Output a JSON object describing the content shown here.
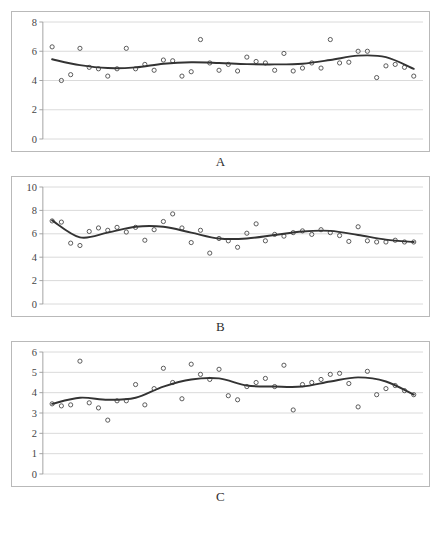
{
  "figure": {
    "title": "",
    "panel_count": 3
  },
  "chart_data": [
    {
      "id": "A",
      "type": "scatter",
      "title": "",
      "caption": "A",
      "xlabel": "",
      "ylabel": "",
      "ylim": [
        0,
        8
      ],
      "yticks": [
        0,
        2,
        4,
        6,
        8
      ],
      "yticklabels": [
        "0",
        "2",
        "4",
        "6",
        "8"
      ],
      "xlim": [
        0,
        41
      ],
      "xticks": [],
      "grid": true,
      "legend": "none",
      "series": [
        {
          "name": "observations",
          "marker": "open-circle",
          "x": [
            1,
            2,
            3,
            4,
            5,
            6,
            7,
            8,
            9,
            10,
            11,
            12,
            13,
            14,
            15,
            16,
            17,
            18,
            19,
            20,
            21,
            22,
            23,
            24,
            25,
            26,
            27,
            28,
            29,
            30,
            31,
            32,
            33,
            34,
            35,
            36,
            37,
            38,
            39,
            40
          ],
          "values": [
            6.3,
            4.0,
            4.4,
            6.2,
            4.9,
            4.8,
            4.3,
            4.8,
            6.2,
            4.8,
            5.1,
            4.7,
            5.4,
            5.35,
            4.3,
            4.6,
            6.8,
            5.2,
            4.7,
            5.1,
            4.65,
            5.6,
            5.3,
            5.2,
            4.7,
            5.85,
            4.65,
            4.85,
            5.2,
            4.85,
            6.8,
            5.2,
            5.25,
            6.0,
            6.0,
            4.2,
            5.0,
            5.1,
            4.9,
            4.3
          ]
        },
        {
          "name": "smoothed-trend",
          "marker": "line",
          "x": [
            1,
            4,
            7,
            10,
            13,
            16,
            19,
            22,
            25,
            28,
            31,
            34,
            37,
            40
          ],
          "values": [
            5.45,
            5.05,
            4.85,
            4.9,
            5.15,
            5.25,
            5.2,
            5.12,
            5.1,
            5.15,
            5.4,
            5.7,
            5.6,
            4.8
          ]
        }
      ]
    },
    {
      "id": "B",
      "type": "scatter",
      "title": "",
      "caption": "B",
      "xlabel": "",
      "ylabel": "",
      "ylim": [
        0,
        10
      ],
      "yticks": [
        0,
        2,
        4,
        6,
        8,
        10
      ],
      "yticklabels": [
        "0",
        "2",
        "4",
        "6",
        "8",
        "10"
      ],
      "xlim": [
        0,
        41
      ],
      "xticks": [],
      "grid": true,
      "legend": "none",
      "series": [
        {
          "name": "observations",
          "marker": "open-circle",
          "x": [
            1,
            2,
            3,
            4,
            5,
            6,
            7,
            8,
            9,
            10,
            11,
            12,
            13,
            14,
            15,
            16,
            17,
            18,
            19,
            20,
            21,
            22,
            23,
            24,
            25,
            26,
            27,
            28,
            29,
            30,
            31,
            32,
            33,
            34,
            35,
            36,
            37,
            38,
            39,
            40
          ],
          "values": [
            7.1,
            7.0,
            5.2,
            5.0,
            6.2,
            6.5,
            6.3,
            6.55,
            6.15,
            6.55,
            5.45,
            6.35,
            7.05,
            7.7,
            6.5,
            5.25,
            6.3,
            4.35,
            5.6,
            5.4,
            4.85,
            6.05,
            6.85,
            5.4,
            5.95,
            5.8,
            6.1,
            6.25,
            5.95,
            6.35,
            6.1,
            5.85,
            5.35,
            6.6,
            5.4,
            5.3,
            5.3,
            5.45,
            5.3,
            5.3
          ]
        },
        {
          "name": "smoothed-trend",
          "marker": "line",
          "x": [
            1,
            4,
            7,
            10,
            13,
            16,
            19,
            22,
            25,
            28,
            31,
            34,
            37,
            40
          ],
          "values": [
            7.15,
            5.7,
            6.1,
            6.6,
            6.6,
            6.1,
            5.6,
            5.6,
            5.9,
            6.2,
            6.25,
            5.9,
            5.5,
            5.3
          ]
        }
      ]
    },
    {
      "id": "C",
      "type": "scatter",
      "title": "",
      "caption": "C",
      "xlabel": "",
      "ylabel": "",
      "ylim": [
        0,
        6
      ],
      "yticks": [
        0,
        1,
        2,
        3,
        4,
        5,
        6
      ],
      "yticklabels": [
        "0",
        "1",
        "2",
        "3",
        "4",
        "5",
        "6"
      ],
      "xlim": [
        0,
        41
      ],
      "xticks": [],
      "grid": true,
      "legend": "none",
      "series": [
        {
          "name": "observations",
          "marker": "open-circle",
          "x": [
            1,
            2,
            3,
            4,
            5,
            6,
            7,
            8,
            9,
            10,
            11,
            12,
            13,
            14,
            15,
            16,
            17,
            18,
            19,
            20,
            21,
            22,
            23,
            24,
            25,
            26,
            27,
            28,
            29,
            30,
            31,
            32,
            33,
            34,
            35,
            36,
            37,
            38,
            39,
            40
          ],
          "values": [
            3.45,
            3.35,
            3.4,
            5.55,
            3.5,
            3.25,
            2.65,
            3.6,
            3.6,
            4.4,
            3.4,
            4.2,
            5.2,
            4.5,
            3.7,
            5.4,
            4.9,
            4.65,
            5.15,
            3.85,
            3.65,
            4.3,
            4.5,
            4.7,
            4.3,
            5.35,
            3.15,
            4.4,
            4.5,
            4.65,
            4.9,
            4.95,
            4.45,
            3.3,
            5.05,
            3.9,
            4.2,
            4.35,
            4.1,
            3.9
          ]
        },
        {
          "name": "smoothed-trend",
          "marker": "line",
          "x": [
            1,
            4,
            7,
            10,
            13,
            16,
            19,
            22,
            25,
            28,
            31,
            34,
            37,
            40
          ],
          "values": [
            3.45,
            3.75,
            3.65,
            3.75,
            4.3,
            4.65,
            4.7,
            4.35,
            4.3,
            4.3,
            4.55,
            4.75,
            4.55,
            3.9
          ]
        }
      ]
    }
  ]
}
